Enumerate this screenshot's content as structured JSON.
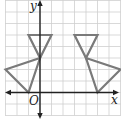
{
  "diagram": {
    "type": "coordinate-grid-reflection",
    "axes": {
      "x_label": "x",
      "y_label": "y",
      "origin_label": "O"
    },
    "grid": {
      "x_min": -3,
      "x_max": 7,
      "y_min": -2,
      "y_max": 8,
      "color": "#cfcfcf"
    },
    "shapes": [
      {
        "name": "original",
        "triangles": [
          [
            [
              -1,
              5
            ],
            [
              1,
              5
            ],
            [
              0,
              3
            ]
          ],
          [
            [
              -3,
              2
            ],
            [
              0,
              3
            ],
            [
              -1,
              0
            ]
          ]
        ]
      },
      {
        "name": "image",
        "triangles": [
          [
            [
              3,
              5
            ],
            [
              5,
              5
            ],
            [
              4,
              3
            ]
          ],
          [
            [
              4,
              3
            ],
            [
              7,
              2
            ],
            [
              5,
              0
            ]
          ]
        ]
      }
    ],
    "colors": {
      "shape_stroke": "#7a7a7a",
      "axis": "#222222"
    }
  }
}
